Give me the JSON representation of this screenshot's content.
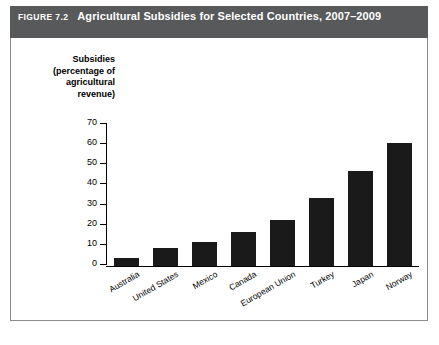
{
  "header": {
    "figure_number": "FIGURE 7.2",
    "title": "Agricultural Subsidies for Selected Countries, 2007–2009",
    "background_color": "#58595b",
    "text_color": "#ffffff"
  },
  "chart_data": {
    "type": "bar",
    "title": "Agricultural Subsidies for Selected Countries, 2007–2009",
    "xlabel": "",
    "ylabel": "Subsidies (percentage of agricultural revenue)",
    "ylabel_lines": [
      "Subsidies",
      "(percentage of",
      "agricultural",
      "revenue)"
    ],
    "categories": [
      "Australia",
      "United States",
      "Mexico",
      "Canada",
      "European Union",
      "Turkey",
      "Japan",
      "Norway"
    ],
    "values": [
      4,
      9,
      12,
      17,
      23,
      34,
      47,
      61
    ],
    "ylim": [
      0,
      70
    ],
    "yticks": [
      0,
      10,
      20,
      30,
      40,
      50,
      60,
      70
    ],
    "ytick_labels": [
      "0",
      "10",
      "20",
      "30",
      "40",
      "50",
      "60",
      "70"
    ],
    "grid": false,
    "legend": false,
    "bar_color": "#1a1a1a",
    "axis_color": "#000000"
  }
}
